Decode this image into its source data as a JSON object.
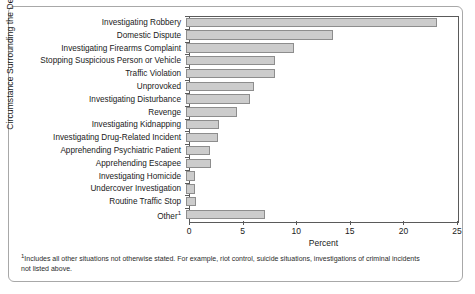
{
  "chart_data": {
    "type": "bar",
    "orientation": "horizontal",
    "title": "",
    "xlabel": "Percent",
    "ylabel": "Circumstance Surrounding the Death",
    "xlim": [
      0,
      25
    ],
    "xticks": [
      0,
      5,
      10,
      15,
      20,
      25
    ],
    "xticklabels": [
      "0",
      "5",
      "10",
      "15",
      "20",
      "25"
    ],
    "grid": false,
    "legend": null,
    "categories": [
      "Investigating Robbery",
      "Domestic Dispute",
      "Investigating Firearms Complaint",
      "Stopping Suspicious Person or Vehicle",
      "Traffic Violation",
      "Unprovoked",
      "Investigating Disturbance",
      "Revenge",
      "Investigating Kidnapping",
      "Investigating Drug-Related Incident",
      "Apprehending Psychiatric Patient",
      "Apprehending Escapee",
      "Investigating Homicide",
      "Undercover Investigation",
      "Routine Traffic Stop",
      "Other"
    ],
    "category_footnote_marks": [
      "",
      "",
      "",
      "",
      "",
      "",
      "",
      "",
      "",
      "",
      "",
      "",
      "",
      "",
      "",
      "1"
    ],
    "values": [
      23.4,
      13.7,
      10.1,
      8.3,
      8.3,
      6.3,
      6.0,
      4.8,
      3.1,
      3.0,
      2.2,
      2.3,
      0.8,
      0.8,
      0.9,
      7.4
    ],
    "bar_fill_color": "#cccccc",
    "bar_edge_color": "#8d8d8d",
    "axis_color": "#5a5a5a"
  },
  "footnote": {
    "marker": "1",
    "text": "Includes all other situations not otherwise stated. For example, riot control, suicide situations, investigations of criminal incidents not listed above."
  }
}
